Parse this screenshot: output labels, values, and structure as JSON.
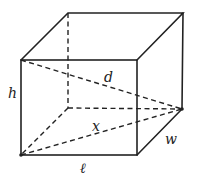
{
  "figure": {
    "type": "rectangular-box-diagonal",
    "vertices": {
      "front_top_left": [
        21,
        60
      ],
      "front_top_right": [
        137,
        60
      ],
      "front_bottom_left": [
        21,
        155
      ],
      "front_bottom_right": [
        137,
        155
      ],
      "back_top_left": [
        68,
        13
      ],
      "back_top_right": [
        183,
        13
      ],
      "back_bottom_left": [
        68,
        108
      ],
      "back_bottom_right": [
        182,
        109
      ]
    },
    "labels": {
      "height": "h",
      "space_diagonal": "d",
      "base_diagonal": "x",
      "length": "ℓ",
      "width": "w"
    },
    "line_color": "#222222"
  }
}
